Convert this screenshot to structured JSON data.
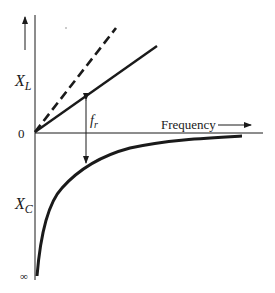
{
  "diagram": {
    "labels": {
      "xl": "X",
      "xl_sub": "L",
      "xc": "X",
      "xc_sub": "C",
      "zero": "0",
      "infinity": "∞",
      "frequency": "Frequency",
      "fr": "f",
      "fr_sub": "r"
    },
    "curves": [
      {
        "name": "XL-line-steep",
        "style": "dashed"
      },
      {
        "name": "XL-line",
        "style": "solid"
      },
      {
        "name": "XC-curve",
        "style": "solid"
      }
    ],
    "colors": {
      "ink": "#1a1a1a",
      "background": "#ffffff"
    }
  }
}
